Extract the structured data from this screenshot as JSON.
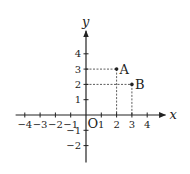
{
  "diagram": {
    "type": "coordinate-plane",
    "x_axis": {
      "label": "x",
      "ticks": [
        -4,
        -3,
        -2,
        -1,
        1,
        2,
        3,
        4
      ],
      "tick_labels": [
        "−4",
        "−3",
        "−2",
        "−1",
        "1",
        "2",
        "3",
        "4"
      ],
      "range": [
        -4.6,
        5.2
      ]
    },
    "y_axis": {
      "label": "y",
      "ticks": [
        -2,
        -1,
        1,
        2,
        3,
        4
      ],
      "tick_labels": [
        "−2",
        "−1",
        "1",
        "2",
        "3",
        "4"
      ],
      "range": [
        -3.1,
        5.5
      ]
    },
    "origin_label": "O",
    "points": [
      {
        "name": "A",
        "x": 2,
        "y": 3
      },
      {
        "name": "B",
        "x": 3,
        "y": 2
      }
    ],
    "colors": {
      "ink": "#222222",
      "background": "#ffffff"
    }
  }
}
